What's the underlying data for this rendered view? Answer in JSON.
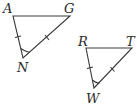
{
  "diagram": {
    "type": "congruent-triangles",
    "stroke_color": "#3a3a3a",
    "triangles": [
      {
        "name": "triangle-AGN",
        "vertices": [
          {
            "label": "A",
            "x": 13,
            "y": 16
          },
          {
            "label": "G",
            "x": 70,
            "y": 16
          },
          {
            "label": "N",
            "x": 23,
            "y": 58
          }
        ],
        "marks": {
          "single_tick_side": "AN",
          "single_tick_side_2": "GN",
          "angle_arc_at": "N"
        }
      },
      {
        "name": "triangle-RTW",
        "vertices": [
          {
            "label": "R",
            "x": 86,
            "y": 48
          },
          {
            "label": "T",
            "x": 132,
            "y": 48
          },
          {
            "label": "W",
            "x": 94,
            "y": 88
          }
        ],
        "marks": {
          "single_tick_side": "RW",
          "single_tick_side_2": "TW",
          "angle_arc_at": "W"
        }
      }
    ]
  },
  "labels": {
    "A": "A",
    "G": "G",
    "N": "N",
    "R": "R",
    "T": "T",
    "W": "W"
  }
}
